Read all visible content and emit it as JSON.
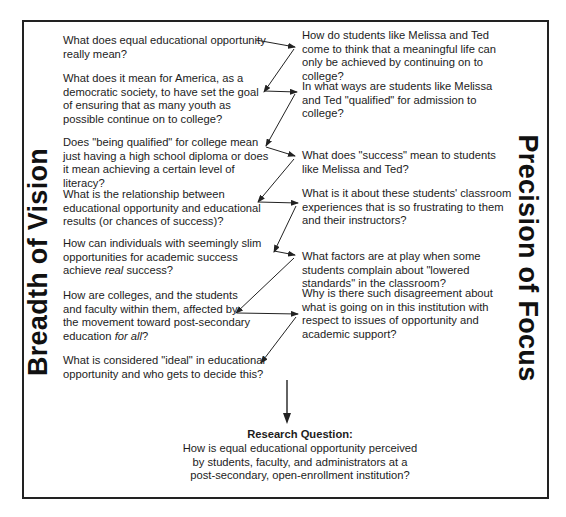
{
  "diagram": {
    "left_label": "Breadth of Vision",
    "right_label": "Precision of Focus",
    "left_questions": [
      {
        "text": "What does equal educational opportunity really mean?"
      },
      {
        "text": "What does it mean for America, as a democratic society, to have set the goal of ensuring that as many youth as possible continue on to college?"
      },
      {
        "text": "Does \"being qualified\" for college mean just having a high school diploma or does it mean achieving a certain level of literacy?"
      },
      {
        "text": "What is the relationship between educational opportunity and educational results (or chances of success)?"
      },
      {
        "text_before": "How can individuals with seemingly slim opportunities for academic success achieve ",
        "italic": "real",
        "text_after": " success?"
      },
      {
        "text_before": "How are colleges, and the students and faculty within them, affected by the movement toward post-secondary education ",
        "italic": "for all",
        "text_after": "?"
      },
      {
        "text": "What is considered \"ideal\" in educational opportunity and who gets to decide this?"
      }
    ],
    "right_questions": [
      {
        "text": "How do students like Melissa and Ted come to think that a meaningful life can only be achieved by continuing on to college?"
      },
      {
        "text": "In what ways are students like Melissa and Ted \"qualified\" for admission to college?"
      },
      {
        "text": "What does \"success\" mean to students like Melissa and Ted?"
      },
      {
        "text": "What is it about these students' classroom experiences that is so frustrating to them and their instructors?"
      },
      {
        "text": "What factors are at play when some students complain about \"lowered standards\" in the classroom?"
      },
      {
        "text": "Why is there such disagreement about what is going on in this institution with respect to issues of opportunity and academic support?"
      }
    ],
    "research_question": {
      "title": "Research Question:",
      "text": "How is equal educational opportunity perceived by students, faculty, and administrators at a post-secondary, open-enrollment institution?"
    },
    "colors": {
      "line": "#222222",
      "text": "#1c1c1c",
      "background": "#ffffff"
    }
  }
}
